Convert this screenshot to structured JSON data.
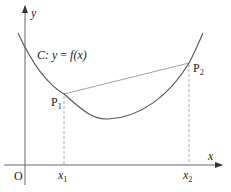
{
  "figure": {
    "axes": {
      "x_label": "x",
      "y_label": "y",
      "origin_label": "O"
    },
    "curve": {
      "name": "C",
      "equation_prefix": "C: ",
      "equation_y": "y",
      "equation_eq": " = ",
      "equation_f": "f",
      "equation_arg": "(x)"
    },
    "points": [
      {
        "name": "P",
        "sub": "1",
        "x_tick": "x",
        "x_tick_sub": "1"
      },
      {
        "name": "P",
        "sub": "2",
        "x_tick": "x",
        "x_tick_sub": "2"
      }
    ],
    "colors": {
      "axis": "#555555",
      "curve": "#555555",
      "chord": "#888888",
      "dashed": "#999999",
      "text": "#222222"
    }
  }
}
